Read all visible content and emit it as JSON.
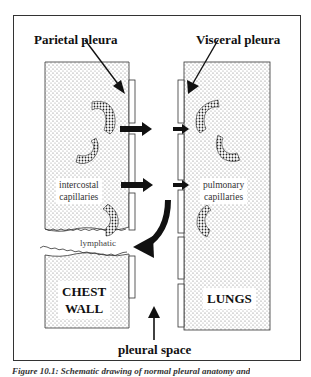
{
  "diagram": {
    "labels": {
      "parietal_pleura": "Parietal pleura",
      "visceral_pleura": "Visceral pleura",
      "intercostal_capillaries_line1": "intercostal",
      "intercostal_capillaries_line2": "capillaries",
      "pulmonary_capillaries_line1": "pulmonary",
      "pulmonary_capillaries_line2": "capillaries",
      "lymphatic": "lymphatic",
      "chest_wall_line1": "CHEST",
      "chest_wall_line2": "WALL",
      "lungs": "LUNGS",
      "pleural_space": "pleural space"
    },
    "caption": "Figure 10.1: Schematic drawing of normal pleural anatomy and",
    "colors": {
      "stroke": "#222222",
      "tissue_fill": "#d9d9d9",
      "background": "#ffffff"
    }
  }
}
